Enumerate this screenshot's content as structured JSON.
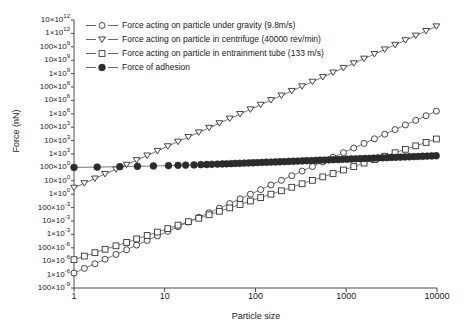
{
  "chart_data": {
    "type": "line",
    "title": "",
    "xlabel": "Particle size",
    "ylabel": "Force (nN)",
    "xscale": "log",
    "yscale": "log",
    "xlim": [
      1,
      10000
    ],
    "ylim": [
      1e-07,
      10000000000000.0
    ],
    "grid": false,
    "legend_position": "top-right-inside",
    "xticks": [
      "1",
      "10",
      "100",
      "1000",
      "10000"
    ],
    "xtick_values": [
      1,
      10,
      100,
      1000,
      10000
    ],
    "yticks": [
      "10×10¹²",
      "1×10¹²",
      "100×10⁹",
      "10×10⁹",
      "1×10⁹",
      "100×10⁶",
      "10×10⁶",
      "1×10⁶",
      "100×10³",
      "10×10³",
      "1×10³",
      "100×10⁰",
      "10×10⁰",
      "1×10⁰",
      "100×10⁻³",
      "10×10⁻³",
      "1×10⁻³",
      "100×10⁻⁶",
      "10×10⁻⁶",
      "1×10⁻⁶",
      "100×10⁻⁹"
    ],
    "ytick_mantissas": [
      "10",
      "1",
      "100",
      "10",
      "1",
      "100",
      "10",
      "1",
      "100",
      "10",
      "1",
      "100",
      "10",
      "1",
      "100",
      "10",
      "1",
      "100",
      "10",
      "1",
      "100"
    ],
    "ytick_exponents": [
      "12",
      "12",
      "9",
      "9",
      "9",
      "6",
      "6",
      "6",
      "3",
      "3",
      "3",
      "0",
      "0",
      "0",
      "-3",
      "-3",
      "-3",
      "-6",
      "-6",
      "-6",
      "-9"
    ],
    "ytick_values": [
      10000000000000.0,
      1000000000000.0,
      100000000000.0,
      10000000000.0,
      1000000000.0,
      100000000.0,
      10000000.0,
      1000000.0,
      100000.0,
      10000.0,
      1000.0,
      100,
      10,
      1,
      0.1,
      0.01,
      0.001,
      0.0001,
      1e-05,
      1e-06,
      1e-07
    ],
    "series": [
      {
        "name": "gravity",
        "label": "Force acting on particle under gravity (9.8m/s)",
        "marker": "open-circle",
        "color": "#444444",
        "x": [
          1,
          1.3,
          1.7,
          2.2,
          2.9,
          3.8,
          4.9,
          6.4,
          8.3,
          10.8,
          14,
          18.2,
          23.7,
          30.8,
          40,
          52,
          67.6,
          87.9,
          114,
          148,
          193,
          251,
          326,
          424,
          551,
          716,
          931,
          1210,
          1573,
          2044,
          2656,
          3452,
          4487,
          5832,
          7579,
          9850
        ],
        "y": [
          1.3e-06,
          2.9e-06,
          6.4e-06,
          1.4e-05,
          3.2e-05,
          7.1e-05,
          0.00016,
          0.00035,
          0.00077,
          0.0017,
          0.0038,
          0.0084,
          0.019,
          0.041,
          0.091,
          0.2,
          0.45,
          1.0,
          2.2,
          4.9,
          10.8,
          24,
          53,
          117,
          259,
          573,
          1265,
          2794,
          6170,
          13630,
          30100,
          66500,
          147000,
          324000,
          716000,
          1580000
        ]
      },
      {
        "name": "centrifuge",
        "label": "Force acting on particle in centrifuge (40000 rev/min)",
        "marker": "open-triangle-down",
        "color": "#444444",
        "x": [
          1,
          1.3,
          1.7,
          2.2,
          2.9,
          3.8,
          4.9,
          6.4,
          8.3,
          10.8,
          14,
          18.2,
          23.7,
          30.8,
          40,
          52,
          67.6,
          87.9,
          114,
          148,
          193,
          251,
          326,
          424,
          551,
          716,
          931,
          1210,
          1573,
          2044,
          2656,
          3452,
          4487,
          5832,
          7579,
          9850
        ],
        "y": [
          3.0,
          6.6,
          14.6,
          32,
          71,
          157,
          348,
          768,
          1700,
          3750,
          8280,
          18300,
          40400,
          89200,
          197000,
          435000,
          961000,
          2120000.0,
          4690000.0,
          10400000.0,
          22900000.0,
          50500000.0,
          112000000.0,
          246000000.0,
          544000000.0,
          1200000000.0,
          2650000000.0,
          5860000000.0,
          12900000000.0,
          28600000000.0,
          63100000000.0,
          139000000000.0,
          308000000000.0,
          680000000000.0,
          1500000000000.0,
          3320000000000.0
        ]
      },
      {
        "name": "entrainment-tube",
        "label": "Force acting on particle in entrainment tube (133 m/s)",
        "marker": "open-square",
        "color": "#444444",
        "x": [
          1,
          1.3,
          1.7,
          2.2,
          2.9,
          3.8,
          4.9,
          6.4,
          8.3,
          10.8,
          14,
          18.2,
          23.7,
          30.8,
          40,
          52,
          67.6,
          87.9,
          114,
          148,
          193,
          251,
          326,
          424,
          551,
          716,
          931,
          1210,
          1573,
          2044,
          2656,
          3452,
          4487,
          5832,
          7579,
          9850
        ],
        "y": [
          1.3e-05,
          2.4e-05,
          4.3e-05,
          7.8e-05,
          0.00014,
          0.00025,
          0.00046,
          0.00083,
          0.0015,
          0.0027,
          0.0049,
          0.0089,
          0.016,
          0.029,
          0.053,
          0.095,
          0.17,
          0.31,
          0.56,
          1.0,
          1.8,
          3.3,
          6.0,
          10.8,
          19.6,
          35,
          64,
          115,
          209,
          378,
          683,
          1236,
          2236,
          4044,
          7315,
          13200
        ]
      },
      {
        "name": "adhesion",
        "label": "Force of adhesion",
        "marker": "filled-circle",
        "color": "#2b2b2b",
        "x": [
          1,
          1.8,
          3.2,
          5.0,
          7.5,
          11,
          14,
          17,
          21,
          25,
          29,
          33,
          38,
          43,
          48,
          54,
          60,
          67,
          75,
          84,
          94,
          105,
          118,
          132,
          148,
          166,
          186,
          208,
          233,
          261,
          292,
          327,
          366,
          410,
          459,
          514,
          576,
          645,
          722,
          809,
          906,
          1015,
          1137,
          1273,
          1426,
          1597,
          1788,
          2003,
          2243,
          2512,
          2814,
          3151,
          3529,
          3953,
          4427,
          4958,
          5553,
          6220,
          6966,
          7802,
          8738,
          9790
        ],
        "y": [
          100,
          105,
          113,
          120,
          128,
          136,
          142,
          148,
          154,
          160,
          165,
          170,
          176,
          181,
          186,
          191,
          197,
          203,
          209,
          215,
          222,
          228,
          235,
          242,
          249,
          256,
          264,
          272,
          280,
          288,
          297,
          306,
          315,
          324,
          334,
          344,
          354,
          365,
          376,
          387,
          399,
          411,
          423,
          436,
          449,
          462,
          476,
          490,
          505,
          520,
          536,
          552,
          568,
          585,
          603,
          621,
          639,
          658,
          678,
          698,
          719,
          740
        ]
      }
    ]
  },
  "legend": {
    "items": [
      {
        "label": "Force acting on particle under gravity (9.8m/s)",
        "marker": "open-circle"
      },
      {
        "label": "Force acting on particle in centrifuge (40000 rev/min)",
        "marker": "open-triangle-down"
      },
      {
        "label": "Force acting on particle in entrainment tube (133 m/s)",
        "marker": "open-square"
      },
      {
        "label": "Force of adhesion",
        "marker": "filled-circle"
      }
    ]
  },
  "style": {
    "axis_color": "#4d4d4d",
    "line_color": "#555555",
    "marker_edge": "#333333",
    "marker_fill_open": "#ffffff",
    "marker_fill_solid": "#2b2b2b",
    "background": "#ffffff"
  }
}
